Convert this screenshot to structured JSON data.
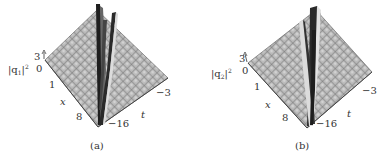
{
  "figure": {
    "panels": [
      {
        "id": "a",
        "caption": "(a)",
        "z_label_base": "|q",
        "z_label_sub": "1",
        "z_label_close": "|",
        "z_label_sup": "2",
        "z_ticks": [
          "3",
          "0"
        ],
        "x_label": "x",
        "x_ticks": [
          "1",
          "8"
        ],
        "t_label": "t",
        "t_ticks": [
          "−3",
          "−16"
        ]
      },
      {
        "id": "b",
        "caption": "(b)",
        "z_label_base": "|q",
        "z_label_sub": "2",
        "z_label_close": "|",
        "z_label_sup": "2",
        "z_ticks": [
          "3",
          "0"
        ],
        "x_label": "x",
        "x_ticks": [
          "1",
          "8"
        ],
        "t_label": "t",
        "t_ticks": [
          "−3",
          "−16"
        ]
      }
    ],
    "colors": {
      "surface_fill": "#b8b8b8",
      "grid_line": "#6a6a6a",
      "peak_dark": "#222222",
      "peak_light": "#e8e8e8",
      "axis": "#333333"
    }
  }
}
